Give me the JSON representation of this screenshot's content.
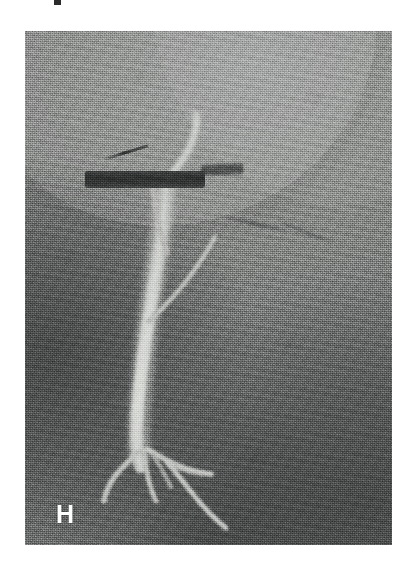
{
  "figure": {
    "panel_label": "H",
    "modality": "digital-subtraction-angiography",
    "caption_fragment": "",
    "background_color": "#ffffff"
  },
  "panel": {
    "name": "angiogram-image",
    "x": 25,
    "y": 31,
    "width": 367,
    "height": 514,
    "base_gray": "#848685",
    "dark_gray": "#5b5d5d",
    "light_gray": "#9a9c9b",
    "vessel_bright": "#c9cbc8",
    "device_dark": "#2c2e2e",
    "label_color": "#ffffff"
  },
  "features": [
    {
      "id": "main-vessel-trunk",
      "name": "contrast-filled-vessel-trunk",
      "description": "Bright vertical vessel running from upper-mid panel down to the lower third",
      "color": "#c9cbc8"
    },
    {
      "id": "upper-branch",
      "name": "upper-vessel-branch",
      "description": "Short bright branch curving up-right from the trunk toward the device bar",
      "color": "#c3c5c2"
    },
    {
      "id": "mid-branch",
      "name": "mid-vessel-branch",
      "description": "Thin bright branch leaving the trunk to the upper right",
      "color": "#b9bbb8"
    },
    {
      "id": "distal-branches",
      "name": "distal-vessel-branches",
      "description": "Fan of thin branching vessels at the caudal end of the trunk",
      "color": "#c2c4c1"
    },
    {
      "id": "device-bar",
      "name": "radiopaque-device-bar",
      "description": "Dark horizontal radio-opaque bar crossing the upper vessel",
      "color": "#2c2e2e"
    },
    {
      "id": "guidewire-upper-left",
      "name": "guidewire-shadow-upper-left",
      "description": "Faint dark oblique wire segment above the device bar",
      "color": "#232525"
    },
    {
      "id": "guidewire-right",
      "name": "guidewire-shadow-right",
      "description": "Faint dark oblique line in the right mid-field",
      "color": "#2e3030"
    }
  ],
  "annotations": {
    "corner_label": {
      "text": "H",
      "position": "bottom-left",
      "color": "#ffffff",
      "font_weight": "bold"
    }
  }
}
